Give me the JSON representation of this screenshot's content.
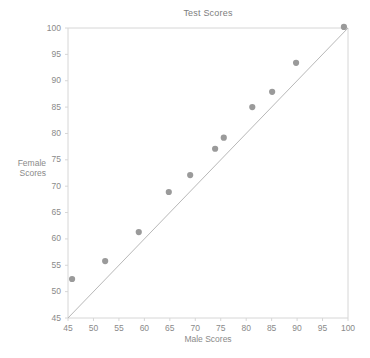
{
  "chart_data": {
    "type": "scatter",
    "title": "Test Scores",
    "xlabel": "Male Scores",
    "ylabel": "Female Scores",
    "ylabel_lines": [
      "Female",
      "Scores"
    ],
    "xlim": [
      45,
      100
    ],
    "ylim": [
      45,
      100
    ],
    "xticks": [
      45,
      50,
      55,
      60,
      65,
      70,
      75,
      80,
      85,
      90,
      95,
      100
    ],
    "yticks": [
      45,
      50,
      55,
      60,
      65,
      70,
      75,
      80,
      85,
      90,
      95,
      100
    ],
    "grid": false,
    "legend": null,
    "marker_color": "#9a9a9a",
    "line_color": "#b8b8b8",
    "axis_color": "#d6d6d6",
    "text_color": "#8a8a8a",
    "reference_line": {
      "label": "y = x identity line",
      "from": [
        45,
        45
      ],
      "to": [
        100,
        100
      ]
    },
    "points": [
      {
        "x": 45.8,
        "y": 52.4
      },
      {
        "x": 52.3,
        "y": 55.8
      },
      {
        "x": 58.9,
        "y": 61.3
      },
      {
        "x": 64.8,
        "y": 68.9
      },
      {
        "x": 69.0,
        "y": 72.1
      },
      {
        "x": 73.9,
        "y": 77.1
      },
      {
        "x": 75.6,
        "y": 79.2
      },
      {
        "x": 81.2,
        "y": 85.0
      },
      {
        "x": 85.1,
        "y": 87.9
      },
      {
        "x": 89.8,
        "y": 93.4
      },
      {
        "x": 99.2,
        "y": 100.2
      }
    ]
  },
  "layout": {
    "plot_left": 68,
    "plot_right": 348,
    "plot_top": 28,
    "plot_bottom": 318
  }
}
